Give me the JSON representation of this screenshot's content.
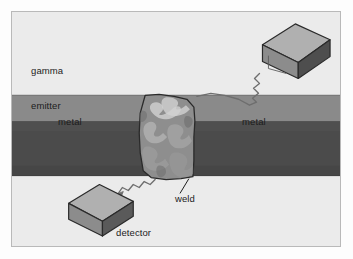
{
  "figure": {
    "background_color": "#ebebeb",
    "page_color": "#fdfdfd",
    "border_color": "#b9b9b9"
  },
  "labels": {
    "gamma_emitter_line1": "gamma",
    "gamma_emitter_line2": "emitter",
    "metal_left": "metal",
    "metal_right": "metal",
    "weld": "weld",
    "detector": "detector"
  },
  "parts": {
    "metal_band": {
      "name": "metal plate",
      "upper_color": "#8a8a8a",
      "lower_color": "#4b4b4b"
    },
    "weld": {
      "name": "weld bead",
      "base_color": "#8e8e8e",
      "highlight_color": "#c9c9c9",
      "outline_color": "#2a2a2a"
    },
    "gamma_emitter": {
      "name": "gamma emitter source box",
      "top_color": "#b0b0b0",
      "front_color": "#8c8c8c",
      "side_color": "#4e4e4e",
      "outline_color": "#2a2a2a"
    },
    "detector": {
      "name": "detector box",
      "top_color": "#b0b0b0",
      "front_color": "#8c8c8c",
      "side_color": "#5a5a5a",
      "outline_color": "#2a2a2a"
    },
    "upper_ray": {
      "name": "gamma ray from emitter to weld",
      "color": "#6e6e6e"
    },
    "lower_ray": {
      "name": "gamma ray from weld to detector",
      "color": "#6e6e6e"
    },
    "weld_leader_line": {
      "name": "leader line from weld label to weld",
      "color": "#1c1c1c"
    }
  }
}
